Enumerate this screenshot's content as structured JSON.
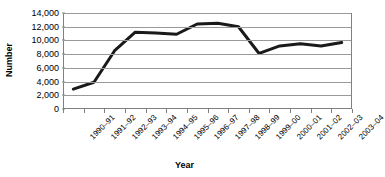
{
  "chart_data": {
    "type": "line",
    "title": "",
    "xlabel": "Year",
    "ylabel": "Number",
    "categories": [
      "1990–91",
      "1991–92",
      "1992–93",
      "1993–94",
      "1994–95",
      "1995–96",
      "1996–97",
      "1997–98",
      "1998–99",
      "1999–00",
      "2000–01",
      "2001–02",
      "2002–03",
      "2003–04"
    ],
    "values": [
      2900,
      3900,
      8500,
      11200,
      11100,
      10900,
      12400,
      12500,
      12000,
      8100,
      9200,
      9500,
      9200,
      9700
    ],
    "series": [
      {
        "name": "Number",
        "values": [
          2900,
          3900,
          8500,
          11200,
          11100,
          10900,
          12400,
          12500,
          12000,
          8100,
          9200,
          9500,
          9200,
          9700
        ],
        "color": "#1a1a1a"
      }
    ],
    "ylim": [
      0,
      14000
    ],
    "y_ticks": [
      0,
      2000,
      4000,
      6000,
      8000,
      10000,
      12000,
      14000
    ],
    "y_tick_labels": [
      "0",
      "2,000",
      "4,000",
      "6,000",
      "8,000",
      "10,000",
      "12,000",
      "14,000"
    ],
    "grid": true,
    "grid_axis": "y",
    "legend": false,
    "legend_position": "none",
    "line_width": 3,
    "markers": false
  },
  "style": {
    "background": "#ffffff",
    "line_color": "#1a1a1a",
    "grid_color": "#9a9a9a",
    "axis_color": "#808080",
    "text_color": "#000000"
  }
}
